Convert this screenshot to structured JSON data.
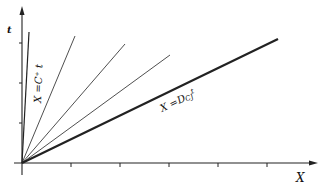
{
  "diagram": {
    "type": "space-time characteristics",
    "axes": {
      "x_label": "X",
      "y_label": "t",
      "x_ticks_count": 6,
      "y_ticks_count": 3
    },
    "lines": [
      {
        "name": "X = C+ t",
        "label": "X =C⁺ t",
        "end": [
          29,
          32
        ],
        "weight": "medium"
      },
      {
        "name": "ray-1",
        "end": [
          75,
          36
        ],
        "weight": "thin"
      },
      {
        "name": "ray-2",
        "end": [
          125,
          44
        ],
        "weight": "thin"
      },
      {
        "name": "ray-3",
        "end": [
          170,
          55
        ],
        "weight": "thin"
      },
      {
        "name": "X = DCJ t",
        "label": "X =Dᴄᴊt",
        "end": [
          278,
          39
        ],
        "weight": "thick"
      }
    ],
    "labels": {
      "c_plus": "X =C⁺ t",
      "dcj": "X =D",
      "dcj_sub": "CJ",
      "dcj_t": "t"
    }
  }
}
